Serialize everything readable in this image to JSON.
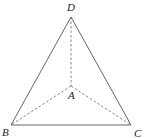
{
  "diagram": {
    "type": "tetrahedron",
    "points": {
      "D": {
        "label": "D",
        "x": 71,
        "y": 17
      },
      "A": {
        "label": "A",
        "x": 71,
        "y": 86
      },
      "B": {
        "label": "B",
        "x": 11,
        "y": 125
      },
      "C": {
        "label": "C",
        "x": 131,
        "y": 125
      }
    },
    "solid_edges": [
      [
        "D",
        "B"
      ],
      [
        "D",
        "C"
      ],
      [
        "B",
        "C"
      ]
    ],
    "dashed_edges": [
      [
        "D",
        "A"
      ],
      [
        "A",
        "B"
      ],
      [
        "A",
        "C"
      ]
    ],
    "line_color": "#555555"
  }
}
